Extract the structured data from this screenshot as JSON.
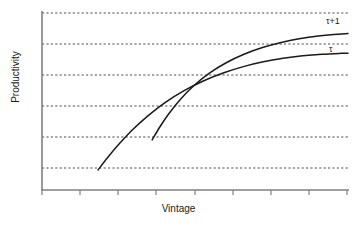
{
  "chart_data": {
    "type": "line",
    "title": "",
    "xlabel": "Vintage",
    "ylabel": "Productivity",
    "grid": true,
    "grid_orientation": "horizontal",
    "grid_style": "dotted",
    "legend_position": "inline-right-end-of-curve",
    "xlim": [
      0,
      1
    ],
    "ylim": [
      0,
      1
    ],
    "xticklabels": [],
    "yticklabels": [],
    "x_tick_count": 8,
    "gridline_count": 6,
    "annotations": [
      {
        "text": "τ+1",
        "target_series": "tau+1"
      },
      {
        "text": "τ",
        "target_series": "tau"
      }
    ],
    "series": [
      {
        "name": "tau",
        "label": "τ",
        "color": "#1a1a1a",
        "description": "Earlier vintage: starts lower and earlier, concave increasing, saturates at lower plateau",
        "x": [
          0.183,
          0.214,
          0.251,
          0.295,
          0.346,
          0.402,
          0.463,
          0.527,
          0.592,
          0.658,
          0.723,
          0.788,
          0.852,
          0.915,
          0.977,
          1.0
        ],
        "y": [
          0.113,
          0.182,
          0.258,
          0.339,
          0.419,
          0.494,
          0.56,
          0.616,
          0.661,
          0.697,
          0.724,
          0.744,
          0.758,
          0.767,
          0.772,
          0.773
        ]
      },
      {
        "name": "tau+1",
        "label": "τ+1",
        "color": "#1a1a1a",
        "description": "Later vintage: starts later and higher, steeper rise, saturates at higher plateau",
        "x": [
          0.36,
          0.385,
          0.415,
          0.452,
          0.496,
          0.546,
          0.602,
          0.662,
          0.723,
          0.785,
          0.845,
          0.902,
          0.953,
          1.0
        ],
        "y": [
          0.283,
          0.356,
          0.432,
          0.512,
          0.589,
          0.659,
          0.719,
          0.768,
          0.806,
          0.835,
          0.856,
          0.87,
          0.879,
          0.884
        ]
      }
    ],
    "crossover_point": {
      "x": 0.525,
      "y": 0.615,
      "note": "the two vintage curves intersect"
    }
  }
}
